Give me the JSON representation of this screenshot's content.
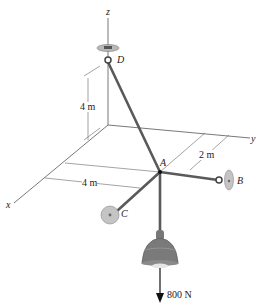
{
  "diagram": {
    "type": "3d-statics-force-diagram",
    "axes": {
      "x": {
        "label": "x"
      },
      "y": {
        "label": "y"
      },
      "z": {
        "label": "z"
      }
    },
    "points": {
      "A": {
        "label": "A"
      },
      "B": {
        "label": "B"
      },
      "C": {
        "label": "C"
      },
      "D": {
        "label": "D"
      }
    },
    "dimensions": {
      "height_D": "4 m",
      "x_offset": "4 m",
      "y_offset": "2 m"
    },
    "load": {
      "label": "800 N",
      "direction": "down"
    },
    "colors": {
      "cable": "#5a5a5a",
      "support": "#b8b8b8",
      "lamp": "#7a7a7a",
      "line": "#444444"
    }
  }
}
